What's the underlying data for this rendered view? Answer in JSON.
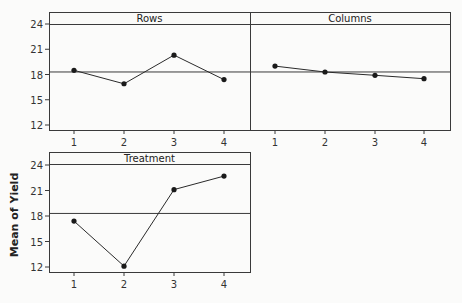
{
  "chart_data": {
    "type": "line",
    "ylabel": "Mean of Yield",
    "ylim": [
      11.5,
      24.5
    ],
    "yticks": [
      12,
      15,
      18,
      21,
      24
    ],
    "grand_mean": 18.3,
    "panels": [
      {
        "name": "Rows",
        "categories": [
          "1",
          "2",
          "3",
          "4"
        ],
        "values": [
          18.5,
          16.9,
          20.3,
          17.4
        ]
      },
      {
        "name": "Columns",
        "categories": [
          "1",
          "2",
          "3",
          "4"
        ],
        "values": [
          19.0,
          18.3,
          17.9,
          17.5
        ]
      },
      {
        "name": "Treatment",
        "categories": [
          "1",
          "2",
          "3",
          "4"
        ],
        "values": [
          17.4,
          12.1,
          21.1,
          22.7
        ]
      }
    ],
    "grid": false,
    "legend": null
  },
  "labels": {
    "ylabel": "Mean of Yield",
    "panel_rows": "Rows",
    "panel_columns": "Columns",
    "panel_treatment": "Treatment"
  }
}
